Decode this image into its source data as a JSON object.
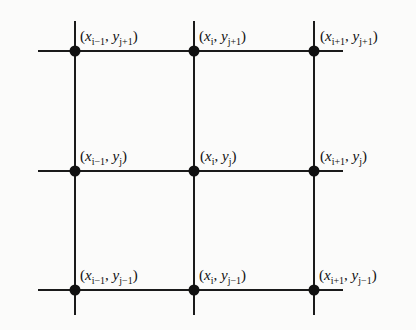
{
  "diagram": {
    "type": "finite-difference-grid",
    "colors": {
      "line": "#1a1a1a",
      "node": "#111111",
      "text": "#111111",
      "background": "#fbfbfa"
    },
    "columns": [
      {
        "x_sub": "i−1"
      },
      {
        "x_sub": "i"
      },
      {
        "x_sub": "i+1"
      }
    ],
    "rows": [
      {
        "y_sub": "j+1"
      },
      {
        "y_sub": "j"
      },
      {
        "y_sub": "j−1"
      }
    ],
    "nodes": [
      {
        "row": 0,
        "col": 0,
        "x_base": "x",
        "x_sub": "i−1",
        "y_base": "y",
        "y_sub": "j+1",
        "text": "(x_{i-1}, y_{j+1})"
      },
      {
        "row": 0,
        "col": 1,
        "x_base": "x",
        "x_sub": "i",
        "y_base": "y",
        "y_sub": "j+1",
        "text": "(x_{i}, y_{j+1})"
      },
      {
        "row": 0,
        "col": 2,
        "x_base": "x",
        "x_sub": "i+1",
        "y_base": "y",
        "y_sub": "j+1",
        "text": "(x_{i+1}, y_{j+1})"
      },
      {
        "row": 1,
        "col": 0,
        "x_base": "x",
        "x_sub": "i−1",
        "y_base": "y",
        "y_sub": "j",
        "text": "(x_{i-1}, y_{j})"
      },
      {
        "row": 1,
        "col": 1,
        "x_base": "x",
        "x_sub": "i",
        "y_base": "y",
        "y_sub": "j",
        "text": "(x_{i}, y_{j})"
      },
      {
        "row": 1,
        "col": 2,
        "x_base": "x",
        "x_sub": "i+1",
        "y_base": "y",
        "y_sub": "j",
        "text": "(x_{i+1}, y_{j})"
      },
      {
        "row": 2,
        "col": 0,
        "x_base": "x",
        "x_sub": "i−1",
        "y_base": "y",
        "y_sub": "j−1",
        "text": "(x_{i-1}, y_{j-1})"
      },
      {
        "row": 2,
        "col": 1,
        "x_base": "x",
        "x_sub": "i",
        "y_base": "y",
        "y_sub": "j−1",
        "text": "(x_{i}, y_{j-1})"
      },
      {
        "row": 2,
        "col": 2,
        "x_base": "x",
        "x_sub": "i+1",
        "y_base": "y",
        "y_sub": "j−1",
        "text": "(x_{i+1}, y_{j-1})"
      }
    ],
    "punctuation": {
      "open": "(",
      "comma": ",",
      "close": ")"
    }
  }
}
